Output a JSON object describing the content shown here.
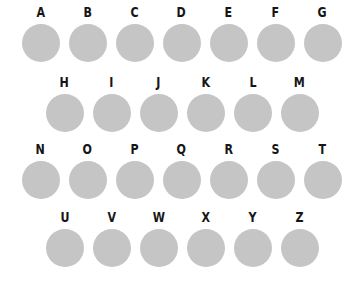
{
  "canvas": {
    "width": 361,
    "height": 285,
    "background_color": "#ffffff"
  },
  "style": {
    "circle_fill_color": "#c5c5c5",
    "label_color": "#161616",
    "circle_diameter_px": 38
  },
  "grid": {
    "row_count": 4,
    "rows": [
      {
        "row_index": 1,
        "indented": false,
        "cells": [
          {
            "label": "A",
            "shape": "circle",
            "fill": "#c5c5c5"
          },
          {
            "label": "B",
            "shape": "circle",
            "fill": "#c5c5c5"
          },
          {
            "label": "C",
            "shape": "circle",
            "fill": "#c5c5c5"
          },
          {
            "label": "D",
            "shape": "circle",
            "fill": "#c5c5c5"
          },
          {
            "label": "E",
            "shape": "circle",
            "fill": "#c5c5c5"
          },
          {
            "label": "F",
            "shape": "circle",
            "fill": "#c5c5c5"
          },
          {
            "label": "G",
            "shape": "circle",
            "fill": "#c5c5c5"
          }
        ]
      },
      {
        "row_index": 2,
        "indented": true,
        "cells": [
          {
            "label": "H",
            "shape": "circle",
            "fill": "#c5c5c5"
          },
          {
            "label": "I",
            "shape": "circle",
            "fill": "#c5c5c5"
          },
          {
            "label": "J",
            "shape": "circle",
            "fill": "#c5c5c5"
          },
          {
            "label": "K",
            "shape": "circle",
            "fill": "#c5c5c5"
          },
          {
            "label": "L",
            "shape": "circle",
            "fill": "#c5c5c5"
          },
          {
            "label": "M",
            "shape": "circle",
            "fill": "#c5c5c5"
          }
        ]
      },
      {
        "row_index": 3,
        "indented": false,
        "cells": [
          {
            "label": "N",
            "shape": "circle",
            "fill": "#c5c5c5"
          },
          {
            "label": "O",
            "shape": "circle",
            "fill": "#c5c5c5"
          },
          {
            "label": "P",
            "shape": "circle",
            "fill": "#c5c5c5"
          },
          {
            "label": "Q",
            "shape": "circle",
            "fill": "#c5c5c5"
          },
          {
            "label": "R",
            "shape": "circle",
            "fill": "#c5c5c5"
          },
          {
            "label": "S",
            "shape": "circle",
            "fill": "#c5c5c5"
          },
          {
            "label": "T",
            "shape": "circle",
            "fill": "#c5c5c5"
          }
        ]
      },
      {
        "row_index": 4,
        "indented": true,
        "cells": [
          {
            "label": "U",
            "shape": "circle",
            "fill": "#c5c5c5"
          },
          {
            "label": "V",
            "shape": "circle",
            "fill": "#c5c5c5"
          },
          {
            "label": "W",
            "shape": "circle",
            "fill": "#c5c5c5"
          },
          {
            "label": "X",
            "shape": "circle",
            "fill": "#c5c5c5"
          },
          {
            "label": "Y",
            "shape": "circle",
            "fill": "#c5c5c5"
          },
          {
            "label": "Z",
            "shape": "circle",
            "fill": "#c5c5c5"
          }
        ]
      }
    ]
  }
}
